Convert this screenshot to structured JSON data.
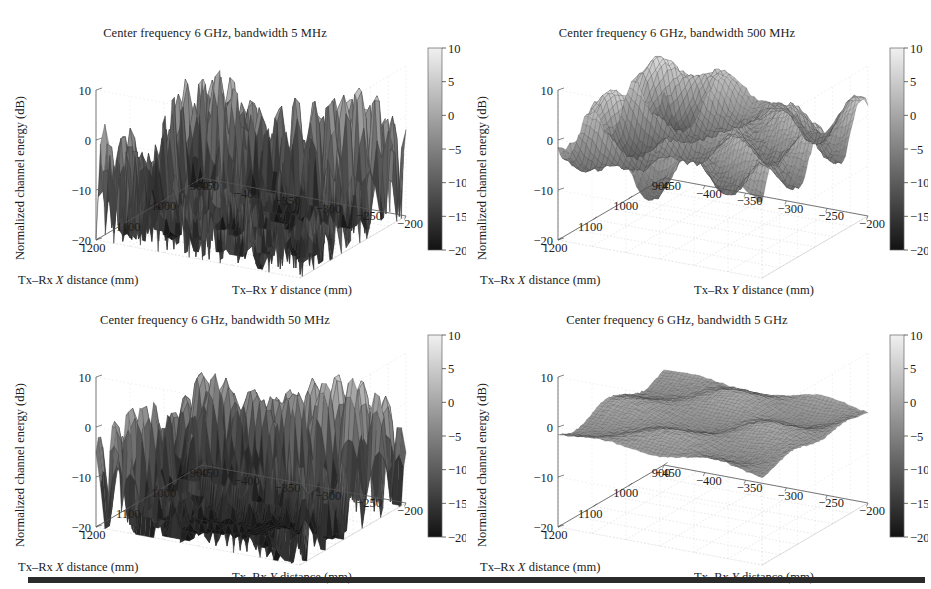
{
  "figure": {
    "background": "#ffffff",
    "text_color": "#1c1c1c",
    "rule_color": "#2b2b2b"
  },
  "panels": [
    {
      "id": "panel-0",
      "title": "Center frequency 6 GHz, bandwidth 5 MHz",
      "bandwidth": "5 MHz",
      "roughness": "very-rough",
      "zlabel": "Normalized channel energy (dB)",
      "xlabel_prefix": "Tx–Rx ",
      "xlabel_italic": "X",
      "xlabel_suffix": " distance (mm)",
      "ylabel_prefix": "Tx–Rx ",
      "ylabel_italic": "Y",
      "ylabel_suffix": " distance (mm)",
      "z_ticks": [
        "10",
        "0",
        "−10",
        "−20"
      ],
      "x_ticks": [
        "1200",
        "1100",
        "1000",
        "900"
      ],
      "y_ticks": [
        "−450",
        "−400",
        "−350",
        "−300",
        "−250",
        "−200"
      ],
      "colorbar_ticks": [
        "10",
        "5",
        "0",
        "−5",
        "−10",
        "−15",
        "−20"
      ]
    },
    {
      "id": "panel-1",
      "title": "Center frequency 6 GHz, bandwidth 500 MHz",
      "bandwidth": "500 MHz",
      "roughness": "low",
      "zlabel": "Normalized channel energy (dB)",
      "xlabel_prefix": "Tx–Rx ",
      "xlabel_italic": "X",
      "xlabel_suffix": " distance (mm)",
      "ylabel_prefix": "Tx–Rx ",
      "ylabel_italic": "Y",
      "ylabel_suffix": " distance (mm)",
      "z_ticks": [
        "10",
        "0",
        "−10",
        "−20"
      ],
      "x_ticks": [
        "1200",
        "1100",
        "1000",
        "900"
      ],
      "y_ticks": [
        "−450",
        "−400",
        "−350",
        "−300",
        "−250",
        "−200"
      ],
      "colorbar_ticks": [
        "10",
        "5",
        "0",
        "−5",
        "−10",
        "−15",
        "−20"
      ]
    },
    {
      "id": "panel-2",
      "title": "Center frequency 6 GHz, bandwidth 50 MHz",
      "bandwidth": "50 MHz",
      "roughness": "rough",
      "zlabel": "Normalized channel energy (dB)",
      "xlabel_prefix": "Tx–Rx ",
      "xlabel_italic": "X",
      "xlabel_suffix": " distance (mm)",
      "ylabel_prefix": "Tx–Rx ",
      "ylabel_italic": "Y",
      "ylabel_suffix": " distance (mm)",
      "z_ticks": [
        "10",
        "0",
        "−10",
        "−20"
      ],
      "x_ticks": [
        "1200",
        "1100",
        "1000",
        "900"
      ],
      "y_ticks": [
        "−450",
        "−400",
        "−350",
        "−300",
        "−250",
        "−200"
      ],
      "colorbar_ticks": [
        "10",
        "5",
        "0",
        "−5",
        "−10",
        "−15",
        "−20"
      ]
    },
    {
      "id": "panel-3",
      "title": "Center frequency 6 GHz, bandwidth 5 GHz",
      "bandwidth": "5 GHz",
      "roughness": "flat",
      "zlabel": "Normalized channel energy (dB)",
      "xlabel_prefix": "Tx–Rx ",
      "xlabel_italic": "X",
      "xlabel_suffix": " distance (mm)",
      "ylabel_prefix": "Tx–Rx ",
      "ylabel_italic": "Y",
      "ylabel_suffix": " distance (mm)",
      "z_ticks": [
        "10",
        "0",
        "−10",
        "−20"
      ],
      "x_ticks": [
        "1200",
        "1100",
        "1000",
        "900"
      ],
      "y_ticks": [
        "−450",
        "−400",
        "−350",
        "−300",
        "−250",
        "−200"
      ],
      "colorbar_ticks": [
        "10",
        "5",
        "0",
        "−5",
        "−10",
        "−15",
        "−20"
      ]
    }
  ],
  "chart_data": [
    {
      "type": "surface",
      "title": "Center frequency 6 GHz, bandwidth 5 MHz",
      "xlabel": "Tx–Rx X distance (mm)",
      "ylabel": "Tx–Rx Y distance (mm)",
      "zlabel": "Normalized channel energy (dB)",
      "xlim": [
        900,
        1200
      ],
      "ylim": [
        -450,
        -200
      ],
      "zlim": [
        -20,
        10
      ],
      "xticks": [
        900,
        1000,
        1100,
        1200
      ],
      "yticks": [
        -450,
        -400,
        -350,
        -300,
        -250,
        -200
      ],
      "zticks": [
        -20,
        -10,
        0,
        10
      ],
      "colormap": "gray",
      "colorbar": {
        "min": -20,
        "max": 10,
        "ticks": [
          -20,
          -15,
          -10,
          -5,
          0,
          5,
          10
        ],
        "orientation": "vertical"
      },
      "grid": true,
      "legend": "none",
      "z_stats": {
        "min": -20,
        "max": 10,
        "mean": -2.0,
        "std": 6.5
      },
      "description": "Deeply faded narrowband surface: many sharp nulls reaching -20 dB and peaks near +10 dB"
    },
    {
      "type": "surface",
      "title": "Center frequency 6 GHz, bandwidth 500 MHz",
      "xlabel": "Tx–Rx X distance (mm)",
      "ylabel": "Tx–Rx Y distance (mm)",
      "zlabel": "Normalized channel energy (dB)",
      "xlim": [
        900,
        1200
      ],
      "ylim": [
        -450,
        -200
      ],
      "zlim": [
        -20,
        10
      ],
      "xticks": [
        900,
        1000,
        1100,
        1200
      ],
      "yticks": [
        -450,
        -400,
        -350,
        -300,
        -250,
        -200
      ],
      "zticks": [
        -20,
        -10,
        0,
        10
      ],
      "colormap": "gray",
      "colorbar": {
        "min": -20,
        "max": 10,
        "ticks": [
          -20,
          -15,
          -10,
          -5,
          0,
          5,
          10
        ],
        "orientation": "vertical"
      },
      "grid": true,
      "legend": "none",
      "z_stats": {
        "min": -6,
        "max": 3,
        "mean": -1.0,
        "std": 1.6
      },
      "description": "Mostly flat surface around 0 dB with gentle ripples of about 3 dB amplitude"
    },
    {
      "type": "surface",
      "title": "Center frequency 6 GHz, bandwidth 50 MHz",
      "xlabel": "Tx–Rx X distance (mm)",
      "ylabel": "Tx–Rx Y distance (mm)",
      "zlabel": "Normalized channel energy (dB)",
      "xlim": [
        900,
        1200
      ],
      "ylim": [
        -450,
        -200
      ],
      "zlim": [
        -20,
        10
      ],
      "xticks": [
        900,
        1000,
        1100,
        1200
      ],
      "yticks": [
        -450,
        -400,
        -350,
        -300,
        -250,
        -200
      ],
      "zticks": [
        -20,
        -10,
        0,
        10
      ],
      "colormap": "gray",
      "colorbar": {
        "min": -20,
        "max": 10,
        "ticks": [
          -20,
          -15,
          -10,
          -5,
          0,
          5,
          10
        ],
        "orientation": "vertical"
      },
      "grid": true,
      "legend": "none",
      "z_stats": {
        "min": -18,
        "max": 7,
        "mean": -2.0,
        "std": 4.5
      },
      "description": "Moderately rough surface with rolling peaks near +6 dB and nulls to about -18 dB"
    },
    {
      "type": "surface",
      "title": "Center frequency 6 GHz, bandwidth 5 GHz",
      "xlabel": "Tx–Rx X distance (mm)",
      "ylabel": "Tx–Rx Y distance (mm)",
      "zlabel": "Normalized channel energy (dB)",
      "xlim": [
        900,
        1200
      ],
      "ylim": [
        -450,
        -200
      ],
      "zlim": [
        -20,
        10
      ],
      "xticks": [
        900,
        1000,
        1100,
        1200
      ],
      "yticks": [
        -450,
        -400,
        -350,
        -300,
        -250,
        -200
      ],
      "zticks": [
        -20,
        -10,
        0,
        10
      ],
      "colormap": "gray",
      "colorbar": {
        "min": -20,
        "max": 10,
        "ticks": [
          -20,
          -15,
          -10,
          -5,
          0,
          5,
          10
        ],
        "orientation": "vertical"
      },
      "grid": true,
      "legend": "none",
      "z_stats": {
        "min": -2,
        "max": 1.5,
        "mean": -0.3,
        "std": 0.6
      },
      "description": "Essentially flat surface at 0 dB; ultra-wideband averaging removes small-scale fading"
    }
  ]
}
